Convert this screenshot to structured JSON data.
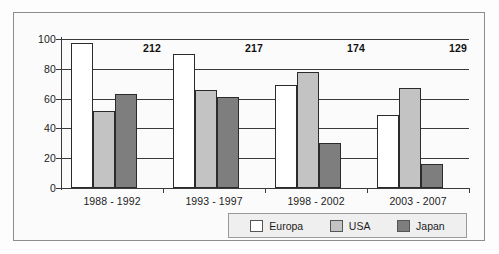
{
  "chart_data": {
    "type": "bar",
    "title": "",
    "xlabel": "",
    "ylabel": "",
    "ylim": [
      0,
      100
    ],
    "yticks": [
      0,
      20,
      40,
      60,
      80,
      100
    ],
    "grid": true,
    "legend_position": "bottom-right",
    "categories": [
      "1988 - 1992",
      "1993 - 1997",
      "1998 - 2002",
      "2003 - 2007"
    ],
    "series": [
      {
        "name": "Europa",
        "color": "#ffffff",
        "values": [
          97,
          90,
          69,
          49
        ]
      },
      {
        "name": "USA",
        "color": "#c3c3c3",
        "values": [
          52,
          66,
          78,
          67
        ]
      },
      {
        "name": "Japan",
        "color": "#7e7e7e",
        "values": [
          63,
          61,
          30,
          16
        ]
      }
    ],
    "group_annotations": [
      "212",
      "217",
      "174",
      "129"
    ]
  },
  "axis": {
    "y_tick_labels": [
      "100",
      "80",
      "60",
      "40",
      "20",
      "0"
    ]
  },
  "legend": {
    "items": [
      {
        "label": "Europa"
      },
      {
        "label": "USA"
      },
      {
        "label": "Japan"
      }
    ]
  }
}
